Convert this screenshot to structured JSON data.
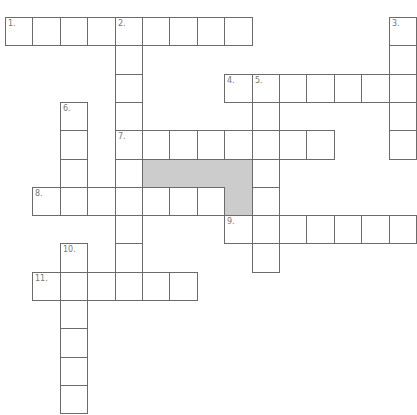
{
  "puzzle": {
    "grid": {
      "cols": 15,
      "rows": 14,
      "origin_x": 5,
      "origin_y": 17,
      "cell_w": 27.4,
      "cell_h": 28.3
    },
    "colors": {
      "line": "#6b6b6b",
      "block": "#cccccc",
      "number": "#777777",
      "background": "#ffffff"
    },
    "entries": [
      {
        "number": "1.",
        "direction": "across",
        "row": 0,
        "col": 0,
        "length": 9
      },
      {
        "number": "2.",
        "direction": "down",
        "row": 0,
        "col": 4,
        "length": 10
      },
      {
        "number": "3.",
        "direction": "down",
        "row": 0,
        "col": 14,
        "length": 5
      },
      {
        "number": "4.",
        "direction": "across",
        "row": 2,
        "col": 8,
        "length": 7
      },
      {
        "number": "5.",
        "direction": "down",
        "row": 2,
        "col": 9,
        "length": 7
      },
      {
        "number": "6.",
        "direction": "down",
        "row": 3,
        "col": 2,
        "length": 4
      },
      {
        "number": "7.",
        "direction": "across",
        "row": 4,
        "col": 4,
        "length": 8
      },
      {
        "number": "8.",
        "direction": "across",
        "row": 6,
        "col": 1,
        "length": 7
      },
      {
        "number": "9.",
        "direction": "across",
        "row": 7,
        "col": 8,
        "length": 7
      },
      {
        "number": "10.",
        "direction": "down",
        "row": 8,
        "col": 2,
        "length": 6
      },
      {
        "number": "11.",
        "direction": "across",
        "row": 9,
        "col": 1,
        "length": 6
      }
    ],
    "blocks": [
      {
        "row": 5,
        "col": 5
      },
      {
        "row": 5,
        "col": 6
      },
      {
        "row": 5,
        "col": 7
      },
      {
        "row": 5,
        "col": 8
      },
      {
        "row": 6,
        "col": 8
      }
    ]
  }
}
